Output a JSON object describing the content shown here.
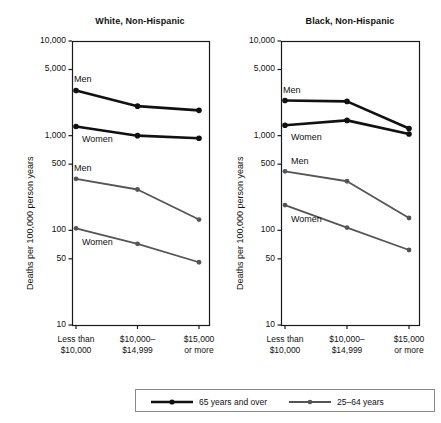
{
  "figure": {
    "y_axis_title": "Deaths per 100,000 person years"
  },
  "legend": {
    "entries": [
      {
        "label": "65 years and over",
        "color": "#111111",
        "marker": "filled-circle",
        "line_width": 2.6
      },
      {
        "label": "25–64 years",
        "color": "#555555",
        "marker": "filled-circle",
        "line_width": 1.7
      }
    ]
  },
  "chart_data": [
    {
      "type": "line",
      "title": "White, Non-Hispanic",
      "xlabel": "",
      "ylabel": "Deaths per 100,000 person years",
      "yscale": "log",
      "ylim": [
        10,
        10000
      ],
      "yticks": [
        10,
        50,
        100,
        500,
        1000,
        5000,
        10000
      ],
      "ytick_labels": [
        "10",
        "50",
        "100",
        "500",
        "1,000",
        "5,000",
        "10,000"
      ],
      "categories": [
        "Less than $10,000",
        "$10,000–$14,999",
        "$15,000 or more"
      ],
      "xtick_labels": [
        [
          "Less than",
          "$10,000"
        ],
        [
          "$10,000–",
          "$14,999"
        ],
        [
          "$15,000",
          "or more"
        ]
      ],
      "grid": false,
      "legend_position": "below-figure",
      "series": [
        {
          "name": "Men 65 years and over",
          "age_group": "65 years and over",
          "sex": "Men",
          "color": "#111111",
          "values": [
            3000,
            2050,
            1850
          ],
          "point_label": "Men"
        },
        {
          "name": "Women 65 years and over",
          "age_group": "65 years and over",
          "sex": "Women",
          "color": "#111111",
          "values": [
            1250,
            1000,
            940
          ],
          "point_label": "Women"
        },
        {
          "name": "Men 25–64 years",
          "age_group": "25–64 years",
          "sex": "Men",
          "color": "#555555",
          "values": [
            350,
            270,
            130
          ],
          "point_label": "Men"
        },
        {
          "name": "Women 25–64 years",
          "age_group": "25–64 years",
          "sex": "Women",
          "color": "#555555",
          "values": [
            105,
            72,
            46
          ],
          "point_label": "Women"
        }
      ]
    },
    {
      "type": "line",
      "title": "Black, Non-Hispanic",
      "xlabel": "",
      "ylabel": "Deaths per 100,000 person years",
      "yscale": "log",
      "ylim": [
        10,
        10000
      ],
      "yticks": [
        10,
        50,
        100,
        500,
        1000,
        5000,
        10000
      ],
      "ytick_labels": [
        "10",
        "50",
        "100",
        "500",
        "1,000",
        "5,000",
        "10,000"
      ],
      "categories": [
        "Less than $10,000",
        "$10,000–$14,999",
        "$15,000 or more"
      ],
      "xtick_labels": [
        [
          "Less than",
          "$10,000"
        ],
        [
          "$10,000–",
          "$14,999"
        ],
        [
          "$15,000",
          "or more"
        ]
      ],
      "grid": false,
      "legend_position": "below-figure",
      "series": [
        {
          "name": "Men 65 years and over",
          "age_group": "65 years and over",
          "sex": "Men",
          "color": "#111111",
          "values": [
            2350,
            2300,
            1190
          ],
          "point_label": "Men"
        },
        {
          "name": "Women 65 years and over",
          "age_group": "65 years and over",
          "sex": "Women",
          "color": "#111111",
          "values": [
            1290,
            1450,
            1040
          ],
          "point_label": "Women"
        },
        {
          "name": "Men 25–64 years",
          "age_group": "25–64 years",
          "sex": "Men",
          "color": "#555555",
          "values": [
            420,
            330,
            135
          ],
          "point_label": "Men"
        },
        {
          "name": "Women 25–64 years",
          "age_group": "25–64 years",
          "sex": "Women",
          "color": "#555555",
          "values": [
            185,
            107,
            62
          ],
          "point_label": "Women"
        }
      ]
    }
  ],
  "annotations": {
    "left_panel": [
      {
        "text": "Men",
        "series": "Men 65 years and over"
      },
      {
        "text": "Women",
        "series": "Women 65 years and over"
      },
      {
        "text": "Men",
        "series": "Men 25–64 years"
      },
      {
        "text": "Women",
        "series": "Women 25–64 years"
      }
    ],
    "right_panel": [
      {
        "text": "Men",
        "series": "Men 65 years and over"
      },
      {
        "text": "Women",
        "series": "Women 65 years and over"
      },
      {
        "text": "Men",
        "series": "Men 25–64 years"
      },
      {
        "text": "Women",
        "series": "Women 25–64 years"
      }
    ]
  }
}
